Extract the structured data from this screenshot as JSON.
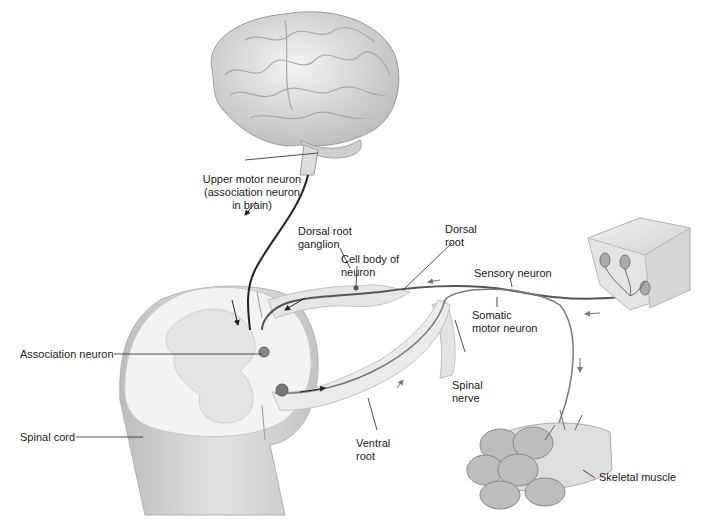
{
  "diagram": {
    "labels": {
      "upper_motor_neuron": "Upper motor neuron\n(association neuron\nin brain)",
      "dorsal_root_ganglion": "Dorsal root\nganglion",
      "cell_body_of_neuron": "Cell body of\nneuron",
      "dorsal_root": "Dorsal\nroot",
      "sensory_neuron": "Sensory neuron",
      "somatic_motor_neuron": "Somatic\nmotor neuron",
      "association_neuron": "Association neuron",
      "spinal_nerve": "Spinal\nnerve",
      "ventral_root": "Ventral\nroot",
      "spinal_cord": "Spinal cord",
      "skeletal_muscle": "Skeletal muscle"
    },
    "colors": {
      "tissue_light": "#eeeeee",
      "tissue_mid": "#d6d6d6",
      "tissue_dark": "#a9a9a9",
      "nerve_line": "#555555",
      "leader_line": "#222222",
      "text": "#1a1a1a"
    }
  }
}
